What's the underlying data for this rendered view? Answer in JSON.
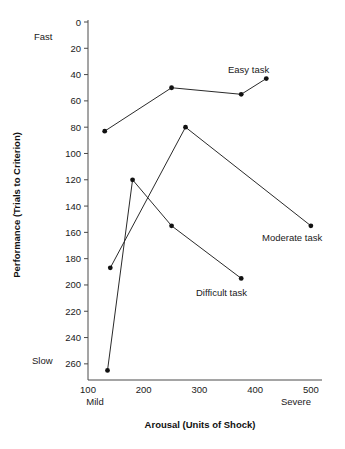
{
  "chart_data": {
    "type": "line",
    "title": "",
    "xlabel": "Arousal (Units of Shock)",
    "ylabel": "Performance (Trials to Criterion)",
    "xlim": [
      100,
      520
    ],
    "ylim": [
      270,
      0
    ],
    "y_inverted": true,
    "grid": false,
    "legend": "inline-endpoint-labels",
    "xticks": [
      100,
      200,
      300,
      400,
      500
    ],
    "xtick_labels": [
      "100",
      "200",
      "300",
      "400",
      "500"
    ],
    "yticks": [
      0,
      20,
      40,
      60,
      80,
      100,
      120,
      140,
      160,
      180,
      200,
      220,
      240,
      260
    ],
    "ytick_labels": [
      "0",
      "20",
      "40",
      "60",
      "80",
      "100",
      "120",
      "140",
      "160",
      "180",
      "200",
      "220",
      "240",
      "260"
    ],
    "x_anchor_low": "Mild",
    "x_anchor_high": "Severe",
    "y_anchor_top": "Fast",
    "y_anchor_bottom": "Slow",
    "series": [
      {
        "name": "Easy task",
        "label": "Easy task",
        "x": [
          130,
          250,
          375,
          420
        ],
        "y": [
          83,
          50,
          55,
          43
        ]
      },
      {
        "name": "Moderate task",
        "label": "Moderate task",
        "x": [
          140,
          275,
          500
        ],
        "y": [
          187,
          80,
          155
        ]
      },
      {
        "name": "Difficult task",
        "label": "Difficult task",
        "x": [
          135,
          180,
          250,
          375
        ],
        "y": [
          265,
          120,
          155,
          195
        ]
      }
    ]
  },
  "labels": {
    "easy_task": "Easy task",
    "moderate_task": "Moderate task",
    "difficult_task": "Difficult task",
    "fast": "Fast",
    "slow": "Slow",
    "mild": "Mild",
    "severe": "Severe",
    "x_axis_title": "Arousal (Units of Shock)",
    "y_axis_title": "Performance (Trials to Criterion)"
  },
  "colors": {
    "line": "#2a2a2a",
    "dot": "#111111",
    "axis": "#4a4a4a",
    "text": "#1a1a1a",
    "background": "#ffffff"
  }
}
